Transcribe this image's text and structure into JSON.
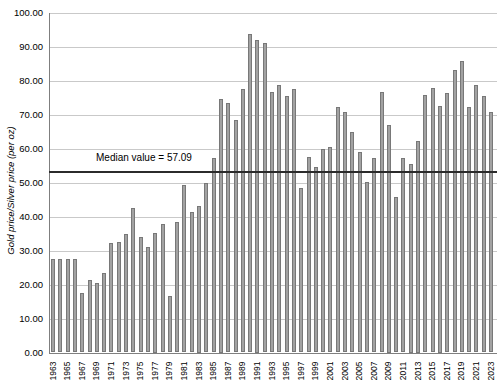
{
  "chart_data": {
    "type": "bar",
    "title": "",
    "xlabel": "",
    "ylabel": "Gold price/Silver price (per oz)",
    "ylim": [
      0,
      100
    ],
    "ytick_step": 10,
    "ytick_labels": [
      "0.00",
      "10.00",
      "20.00",
      "30.00",
      "40.00",
      "50.00",
      "60.00",
      "70.00",
      "80.00",
      "90.00",
      "100.00"
    ],
    "grid": "horizontal",
    "legend": "none",
    "categories": [
      1963,
      1964,
      1965,
      1966,
      1967,
      1968,
      1969,
      1970,
      1971,
      1972,
      1973,
      1974,
      1975,
      1976,
      1977,
      1978,
      1979,
      1980,
      1981,
      1982,
      1983,
      1984,
      1985,
      1986,
      1987,
      1988,
      1989,
      1990,
      1991,
      1992,
      1993,
      1994,
      1995,
      1996,
      1997,
      1998,
      1999,
      2000,
      2001,
      2002,
      2003,
      2004,
      2005,
      2006,
      2007,
      2008,
      2009,
      2010,
      2011,
      2012,
      2013,
      2014,
      2015,
      2016,
      2017,
      2018,
      2019,
      2020,
      2021,
      2022,
      2023
    ],
    "values": [
      27.4,
      27.4,
      27.4,
      27.4,
      17.4,
      21.4,
      20.4,
      23.3,
      32.1,
      32.4,
      34.8,
      42.4,
      34.1,
      31.1,
      35.3,
      37.7,
      16.7,
      38.5,
      49.2,
      41.4,
      43.1,
      49.8,
      57.1,
      74.7,
      73.3,
      68.4,
      77.6,
      93.8,
      91.9,
      91.1,
      76.6,
      78.6,
      75.5,
      77.6,
      48.4,
      57.6,
      54.6,
      59.8,
      60.5,
      72.3,
      70.8,
      64.9,
      59.0,
      50.1,
      57.1,
      76.7,
      66.9,
      45.8,
      57.3,
      55.6,
      62.2,
      75.7,
      77.7,
      72.5,
      76.4,
      83.2,
      85.7,
      72.3,
      78.8,
      75.4,
      70.8
    ],
    "x_tick_labels": [
      "1963",
      "1965",
      "1967",
      "1969",
      "1971",
      "1973",
      "1975",
      "1977",
      "1979",
      "1981",
      "1983",
      "1985",
      "1987",
      "1989",
      "1991",
      "1993",
      "1995",
      "1997",
      "1999",
      "2001",
      "2003",
      "2005",
      "2007",
      "2009",
      "2011",
      "2013",
      "2015",
      "2017",
      "2019",
      "2021",
      "2023"
    ],
    "median_annotation": {
      "label": "Median value = 57.09",
      "line_y_value": 53.2
    },
    "colors": {
      "background": "#ffffff",
      "bar_fill": "#a2a2a2",
      "bar_border": "#787878",
      "gridline": "#c9c9c9",
      "axis_line": "#7f7f7f",
      "median_line": "#2b2b2b",
      "text": "#000000"
    }
  }
}
